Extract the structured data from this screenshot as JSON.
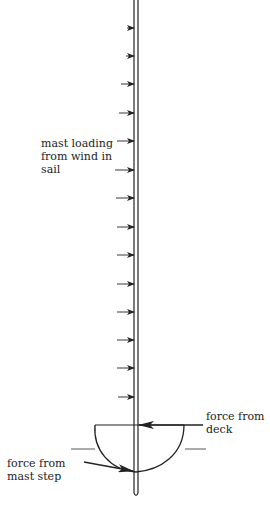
{
  "diagram": {
    "colors": {
      "ink": "#222222",
      "background": "#ffffff"
    },
    "labels": {
      "mast_loading": "mast loading\nfrom wind in\nsail",
      "force_from_deck": "force from\ndeck",
      "force_from_mast_step": "force from\nmast step"
    },
    "mast": {
      "x_left": 134,
      "x_right": 138,
      "top": 0,
      "bottom": 495
    },
    "wind_arrows": {
      "count": 14,
      "y_positions": [
        28,
        56,
        84,
        113,
        141,
        170,
        198,
        227,
        255,
        284,
        312,
        340,
        368,
        397
      ],
      "x_starts": [
        127,
        126,
        121,
        119,
        117,
        115,
        116,
        117,
        117,
        117,
        117,
        117,
        117,
        118
      ]
    },
    "hull": {
      "deck_y": 425,
      "deck_x_left": 95,
      "deck_x_right": 184,
      "step_y": 472
    },
    "waterline": {
      "y": 449,
      "left": [
        71,
        95
      ],
      "right": [
        185,
        206
      ]
    }
  }
}
